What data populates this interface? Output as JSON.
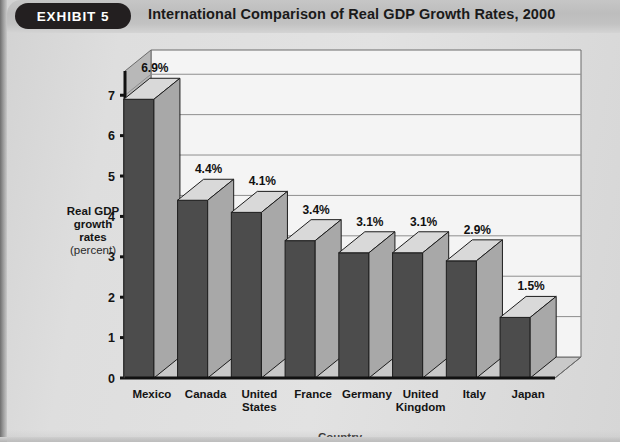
{
  "header": {
    "badge_label": "EXHIBIT 5",
    "title": "International Comparison of Real GDP Growth Rates, 2000",
    "badge_color": "#231f20",
    "bar_color": "#c2c2c2"
  },
  "chart_data": {
    "type": "bar",
    "title": "International Comparison of Real GDP Growth Rates, 2000",
    "xlabel": "Country",
    "ylabel": "Real GDP growth rates (percent)",
    "ylabel_lines": [
      "Real GDP",
      "growth",
      "rates"
    ],
    "ylabel_unit": "(percent)",
    "categories": [
      "Mexico",
      "Canada",
      "United States",
      "France",
      "Germany",
      "United Kingdom",
      "Italy",
      "Japan"
    ],
    "category_lines": [
      [
        "Mexico"
      ],
      [
        "Canada"
      ],
      [
        "United",
        "States"
      ],
      [
        "France"
      ],
      [
        "Germany"
      ],
      [
        "United",
        "Kingdom"
      ],
      [
        "Italy"
      ],
      [
        "Japan"
      ]
    ],
    "values": [
      6.9,
      4.4,
      4.1,
      3.4,
      3.1,
      3.1,
      2.9,
      1.5
    ],
    "data_labels": [
      "6.9%",
      "4.4%",
      "4.1%",
      "3.4%",
      "3.1%",
      "3.1%",
      "2.9%",
      "1.5%"
    ],
    "ylim": [
      0,
      7.6
    ],
    "yticks": [
      0,
      1,
      2,
      3,
      4,
      5,
      6,
      7
    ],
    "ytick_labels": [
      "0",
      "1",
      "2",
      "3",
      "4",
      "5",
      "6",
      "7"
    ],
    "grid": true,
    "legend": false,
    "three_d": true,
    "bar_front_color": "#4c4c4c",
    "bar_top_color": "#d9d9d9",
    "bar_side_color": "#a8a8a8",
    "plot_background": "#f4f4f4",
    "floor_color": "#c9c9c9",
    "wall_color": "#b8b8b8"
  }
}
